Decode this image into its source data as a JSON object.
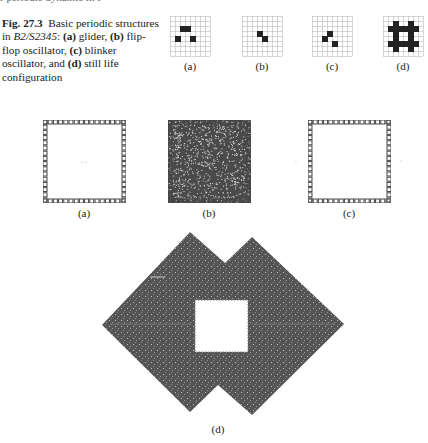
{
  "cutoff_text": "r     periodic    dynamic in   F",
  "caption": {
    "fig_label": "Fig. 27.3",
    "text_before_rule": "Basic periodic structures in ",
    "rule": "B2/S2345",
    "text_after_rule": ":",
    "items": [
      {
        "tag": "(a)",
        "desc": " glider, "
      },
      {
        "tag": "(b)",
        "desc": " flip-flop oscillator, "
      },
      {
        "tag": "(c)",
        "desc": " blinker oscillator, and "
      },
      {
        "tag": "(d)",
        "desc": " still life configuration"
      }
    ]
  },
  "top_row": {
    "grid_size": 8,
    "panels": [
      {
        "label": "(a)",
        "name": "glider",
        "cells": [
          [
            2,
            2
          ],
          [
            2,
            3
          ],
          [
            4,
            1
          ],
          [
            4,
            4
          ]
        ]
      },
      {
        "label": "(b)",
        "name": "flip-flop",
        "cells": [
          [
            3,
            3
          ],
          [
            4,
            4
          ]
        ]
      },
      {
        "label": "(c)",
        "name": "blinker",
        "cells": [
          [
            3,
            3
          ],
          [
            4,
            2
          ],
          [
            5,
            4
          ]
        ]
      },
      {
        "label": "(d)",
        "name": "still-life",
        "cells": [
          [
            1,
            2
          ],
          [
            1,
            5
          ],
          [
            2,
            1
          ],
          [
            2,
            2
          ],
          [
            2,
            3
          ],
          [
            2,
            4
          ],
          [
            2,
            5
          ],
          [
            2,
            6
          ],
          [
            3,
            2
          ],
          [
            3,
            5
          ],
          [
            4,
            2
          ],
          [
            4,
            5
          ],
          [
            5,
            1
          ],
          [
            5,
            2
          ],
          [
            5,
            3
          ],
          [
            5,
            4
          ],
          [
            5,
            5
          ],
          [
            5,
            6
          ],
          [
            6,
            2
          ],
          [
            6,
            5
          ]
        ]
      }
    ]
  },
  "middle_row": {
    "panels": [
      {
        "label": "(a)",
        "fill": "empty"
      },
      {
        "label": "(b)",
        "fill": "noise"
      },
      {
        "label": "(c)",
        "fill": "empty"
      }
    ]
  },
  "bottom": {
    "label": "(d)",
    "fill_color": "#555555",
    "outline": [
      [
        102,
        325
      ],
      [
        190,
        232
      ],
      [
        225,
        263
      ],
      [
        252,
        237
      ],
      [
        344,
        324
      ],
      [
        252,
        415
      ],
      [
        218,
        385
      ],
      [
        190,
        412
      ]
    ],
    "hole": [
      195,
      300,
      248,
      352
    ]
  }
}
